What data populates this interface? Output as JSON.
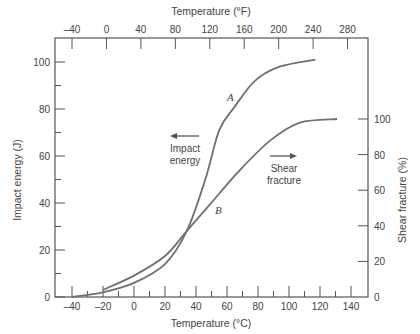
{
  "chart_data": {
    "type": "line",
    "title": "",
    "xlabel": "Temperature (°C)",
    "x2label": "Temperature (°F)",
    "ylabel": "Impact energy (J)",
    "y2label": "Shear fracture (%)",
    "xlim": [
      -50,
      150
    ],
    "ylim": [
      0,
      110
    ],
    "y2lim": [
      0,
      100
    ],
    "x_ticks": [
      -40,
      -20,
      0,
      20,
      40,
      60,
      80,
      100,
      120,
      140
    ],
    "x2_ticks": [
      -40,
      0,
      40,
      80,
      120,
      160,
      200,
      240,
      280
    ],
    "y_ticks": [
      0,
      20,
      40,
      60,
      80,
      100
    ],
    "y2_ticks": [
      0,
      20,
      40,
      60,
      80,
      100
    ],
    "grid": false,
    "series": [
      {
        "name": "A",
        "axis": "left",
        "description": "Impact energy",
        "x": [
          -40,
          -20,
          0,
          20,
          34,
          46,
          55,
          65,
          78,
          94,
          117
        ],
        "values": [
          0,
          2,
          6,
          14,
          28,
          50,
          71,
          81,
          92,
          98,
          101
        ]
      },
      {
        "name": "B",
        "axis": "right",
        "description": "Shear fracture",
        "x": [
          -20,
          0,
          20,
          34,
          49,
          68,
          88,
          107,
          131
        ],
        "values": [
          4,
          12,
          23,
          37,
          52,
          71,
          88,
          98,
          100
        ]
      }
    ],
    "annotations": [
      {
        "text": "A",
        "near_series": "A"
      },
      {
        "text": "B",
        "near_series": "B"
      },
      {
        "text_lines": [
          "Impact",
          "energy"
        ],
        "arrow": "left"
      },
      {
        "text_lines": [
          "Shear",
          "fracture"
        ],
        "arrow": "right"
      }
    ]
  },
  "labels": {
    "x_axis": "Temperature (°C)",
    "x2_axis": "Temperature (°F)",
    "y_axis": "Impact energy (J)",
    "y2_axis": "Shear fracture (%)",
    "curve_a": "A",
    "curve_b": "B",
    "impact_line1": "Impact",
    "impact_line2": "energy",
    "shear_line1": "Shear",
    "shear_line2": "fracture"
  },
  "style": {
    "axis_color": "#555555",
    "curve_color": "#707070",
    "text_color": "#444444"
  }
}
